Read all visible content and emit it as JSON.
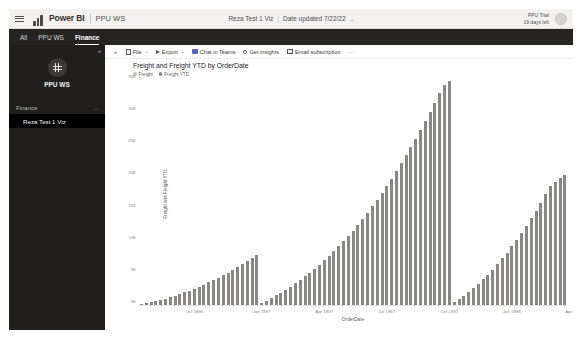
{
  "appbar": {
    "hamburger_icon": "hamburger-menu-icon",
    "logo_icon": "power-bi-logo-icon",
    "brand": "Power BI",
    "workspace": "PPU WS",
    "report_name": "Reza Test 1 Viz",
    "separator": "|",
    "updated": "Date updated 7/22/22",
    "caret": "⌄",
    "trial_line1": "PPU Trial",
    "trial_line2": "19 days left",
    "avatar_name": "user-avatar"
  },
  "tabs": [
    {
      "label": "All",
      "active": false
    },
    {
      "label": "PPU WS",
      "active": false
    },
    {
      "label": "Finance",
      "active": true
    }
  ],
  "sidebar": {
    "collapse_icon": "«",
    "workspace_avatar_icon": "workspace-grid-icon",
    "workspace_title": "PPU WS",
    "section_label": "Finance",
    "section_caret": "⌄",
    "items": [
      {
        "label": "Reza Test 1 Viz",
        "selected": true
      }
    ]
  },
  "toolbar": {
    "collapse_icon": "«",
    "items": [
      {
        "label": "File",
        "icon": "file-icon",
        "caret": "⌄"
      },
      {
        "label": "Export",
        "icon": "export-icon",
        "caret": "⌄"
      },
      {
        "label": "Chat in Teams",
        "icon": "teams-icon",
        "caret": ""
      },
      {
        "label": "Get insights",
        "icon": "lightbulb-icon",
        "caret": ""
      },
      {
        "label": "Email subscription",
        "icon": "mail-icon",
        "caret": ""
      }
    ],
    "more_label": "···"
  },
  "chart_data": {
    "type": "bar",
    "title": "Freight and Freight YTD by OrderDate",
    "xlabel": "OrderDate",
    "ylabel": "Freight and Freight YTD",
    "ylim": [
      0,
      35000
    ],
    "yticks": [
      {
        "value": 0,
        "label": "0K"
      },
      {
        "value": 5000,
        "label": "5K"
      },
      {
        "value": 10000,
        "label": "10K"
      },
      {
        "value": 15000,
        "label": "15K"
      },
      {
        "value": 20000,
        "label": "20K"
      },
      {
        "value": 25000,
        "label": "25K"
      },
      {
        "value": 30000,
        "label": "30K"
      },
      {
        "value": 35000,
        "label": "35K"
      }
    ],
    "grid": false,
    "legend_position": "top-left",
    "legend": [
      {
        "name": "Freight",
        "color": "#c8c6c4"
      },
      {
        "name": "Freight YTD",
        "color": "#8a8886"
      }
    ],
    "xticks": [
      {
        "index": 11,
        "label": "Oct 1996"
      },
      {
        "index": 25,
        "label": "Jan 1997"
      },
      {
        "index": 38,
        "label": "Apr 1997"
      },
      {
        "index": 51,
        "label": "Jul 1997"
      },
      {
        "index": 64,
        "label": "Oct 1997"
      },
      {
        "index": 77,
        "label": "Jan 1998"
      },
      {
        "index": 90,
        "label": "Apr 1998"
      }
    ],
    "series": [
      {
        "name": "Freight YTD",
        "color": "#8a8886",
        "values": [
          120,
          260,
          430,
          620,
          790,
          1010,
          1230,
          1480,
          1720,
          1990,
          2260,
          2560,
          2880,
          3190,
          3530,
          3890,
          4250,
          4650,
          5060,
          5480,
          5920,
          6380,
          6850,
          7350,
          7870,
          330,
          700,
          1090,
          1500,
          1930,
          2390,
          2870,
          3380,
          3910,
          4470,
          5050,
          5660,
          6300,
          6970,
          7670,
          8400,
          9160,
          9950,
          10780,
          11640,
          12530,
          13460,
          14420,
          15420,
          16450,
          17520,
          18620,
          19760,
          20930,
          22140,
          23390,
          24670,
          25990,
          27350,
          28740,
          30170,
          31640,
          33140,
          34450,
          35000,
          420,
          900,
          1430,
          2000,
          2620,
          3280,
          3990,
          4740,
          5540,
          6380,
          7270,
          8200,
          9180,
          10200,
          11270,
          12380,
          13540,
          14740,
          15990,
          17280,
          18620,
          19280,
          19900,
          20300
        ]
      },
      {
        "name": "Freight",
        "color": "#c8c6c4",
        "values": [
          120,
          140,
          170,
          190,
          170,
          220,
          220,
          250,
          240,
          270,
          270,
          300,
          320,
          310,
          340,
          360,
          360,
          400,
          410,
          420,
          440,
          460,
          470,
          500,
          520,
          330,
          370,
          390,
          410,
          430,
          460,
          480,
          510,
          530,
          560,
          580,
          610,
          640,
          670,
          700,
          730,
          760,
          790,
          830,
          860,
          890,
          930,
          960,
          1000,
          1030,
          1070,
          1100,
          1140,
          1170,
          1210,
          1250,
          1280,
          1320,
          1360,
          1390,
          1430,
          1470,
          1500,
          1310,
          550,
          420,
          480,
          530,
          570,
          620,
          660,
          710,
          750,
          800,
          840,
          890,
          930,
          980,
          1020,
          1070,
          1110,
          1160,
          1200,
          1250,
          1290,
          1340,
          660,
          620,
          400
        ]
      }
    ]
  }
}
